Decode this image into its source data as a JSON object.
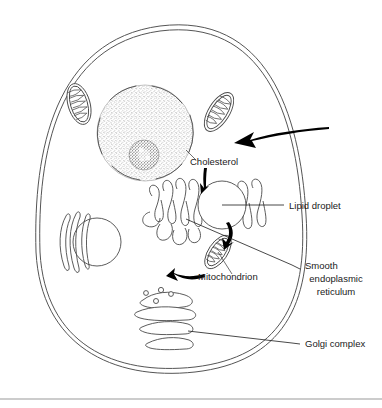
{
  "figure": {
    "background_color": "#ffffff",
    "line_color": "#4a4a4a",
    "label_color": "#1a1a1a",
    "width": 382,
    "height": 408
  },
  "labels": {
    "cholesterol": "Cholesterol",
    "lipid_droplet": "Lipid droplet",
    "mitochondrion": "Mitochondrion",
    "smooth_er_line1": "Smooth",
    "smooth_er_line2": "endoplasmic",
    "smooth_er_line3": "reticulum",
    "golgi_complex": "Golgi complex"
  },
  "structures": [
    {
      "name": "plasma-membrane",
      "description": "double-line cell boundary"
    },
    {
      "name": "nucleus",
      "description": "stippled round nucleus with nuclear envelope arcs"
    },
    {
      "name": "nucleolus",
      "description": "dark granular ring inside nucleus"
    },
    {
      "name": "mitochondrion-upper-left",
      "description": "oval organelle with cristae"
    },
    {
      "name": "mitochondrion-upper-right",
      "description": "tilted oval organelle with cristae"
    },
    {
      "name": "mitochondrion-center",
      "description": "tilted oval organelle with cristae, labelled"
    },
    {
      "name": "smooth-endoplasmic-reticulum",
      "description": "finger-like tubule network"
    },
    {
      "name": "lipid-droplet",
      "description": "plain circle"
    },
    {
      "name": "vacuole",
      "description": "large plain circle at left"
    },
    {
      "name": "rough-er-strands",
      "description": "three curved strands left of vacuole"
    },
    {
      "name": "golgi-complex",
      "description": "four stacked flattened cisternae with vesicles"
    }
  ],
  "annotations": {
    "incoming_arrow": "large curved arrow entering cell from the right",
    "cholesterol_arrow": "short curved arrow from Cholesterol label down to lipid droplet",
    "er_to_mitochondrion_arrow": "curved arrow from smooth ER region to mitochondrion",
    "mitochondrion_to_er_arrow": "curved arrow from mitochondrion back to smooth ER"
  }
}
